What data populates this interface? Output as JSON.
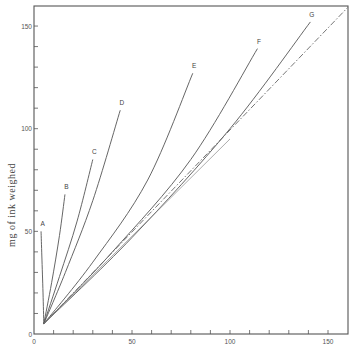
{
  "chart_data": {
    "type": "line",
    "title": "",
    "xlabel": "",
    "ylabel": "mg of ink weighed",
    "xlim": [
      0,
      160
    ],
    "ylim": [
      0,
      160
    ],
    "x_ticks": [
      0,
      50,
      100,
      150
    ],
    "y_ticks": [
      0,
      50,
      100,
      150
    ],
    "minor_tick_step": 10,
    "grid": false,
    "legend": "inline labels at curve ends",
    "series": [
      {
        "name": "A",
        "x": [
          5,
          4.6,
          4.0,
          3.6
        ],
        "y": [
          5,
          20,
          38,
          50
        ]
      },
      {
        "name": "B",
        "x": [
          5,
          9,
          13,
          15.8
        ],
        "y": [
          5,
          25,
          48,
          68
        ]
      },
      {
        "name": "C",
        "x": [
          5,
          13,
          22,
          30
        ],
        "y": [
          5,
          28,
          55,
          85
        ]
      },
      {
        "name": "D",
        "x": [
          5,
          16,
          30,
          44
        ],
        "y": [
          5,
          30,
          65,
          109
        ]
      },
      {
        "name": "E",
        "x": [
          5,
          30,
          58,
          81
        ],
        "y": [
          5,
          35,
          75,
          127
        ]
      },
      {
        "name": "F",
        "x": [
          5,
          40,
          80,
          114
        ],
        "y": [
          5,
          40,
          85,
          139
        ]
      },
      {
        "name": "G",
        "x": [
          5,
          50,
          100,
          141
        ],
        "y": [
          5,
          47,
          100,
          152
        ]
      },
      {
        "name": "reference (dash-dot)",
        "style": "dash-dot",
        "x": [
          5,
          160
        ],
        "y": [
          5,
          159
        ]
      },
      {
        "name": "lower straight",
        "x": [
          5,
          100
        ],
        "y": [
          5,
          95
        ]
      }
    ],
    "curve_labels": [
      "A",
      "B",
      "C",
      "D",
      "E",
      "F",
      "G"
    ]
  }
}
